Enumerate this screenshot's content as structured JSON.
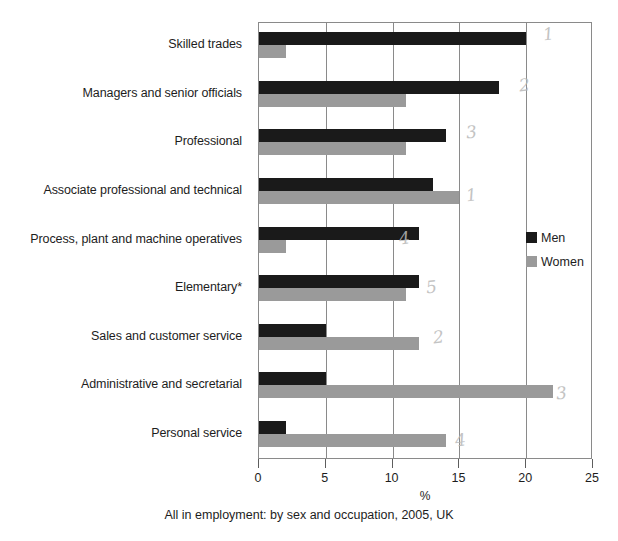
{
  "chart_data": {
    "type": "bar",
    "orientation": "horizontal",
    "title": "",
    "caption": "All in employment: by sex and occupation, 2005, UK",
    "xlabel": "%",
    "ylabel": "",
    "xlim": [
      0,
      25
    ],
    "xticks": [
      0,
      5,
      10,
      15,
      20,
      25
    ],
    "xticklabels": [
      "0",
      "5",
      "10",
      "15",
      "20",
      "25"
    ],
    "grid": "vertical",
    "legend_position": "right",
    "categories": [
      "Skilled trades",
      "Managers and senior officials",
      "Professional",
      "Associate professional and technical",
      "Process, plant and machine operatives",
      "Elementary*",
      "Sales and customer service",
      "Administrative and secretarial",
      "Personal service"
    ],
    "series": [
      {
        "name": "Men",
        "color": "#1a1a1a",
        "values": [
          20,
          18,
          14,
          13,
          12,
          12,
          5,
          5,
          2
        ]
      },
      {
        "name": "Women",
        "color": "#9a9a9a",
        "values": [
          2,
          11,
          11,
          15,
          2,
          11,
          12,
          22,
          14
        ]
      }
    ]
  },
  "legend": {
    "entries": [
      {
        "label": "Men"
      },
      {
        "label": "Women"
      }
    ]
  },
  "annotations": {
    "pencil_marks": [
      {
        "text": "1",
        "x": 543,
        "y": 24
      },
      {
        "text": "2",
        "x": 519,
        "y": 75
      },
      {
        "text": "3",
        "x": 466,
        "y": 122
      },
      {
        "text": "1",
        "x": 466,
        "y": 185
      },
      {
        "text": "4",
        "x": 399,
        "y": 228
      },
      {
        "text": "5",
        "x": 426,
        "y": 277
      },
      {
        "text": "2",
        "x": 433,
        "y": 327
      },
      {
        "text": "3",
        "x": 556,
        "y": 383
      },
      {
        "text": "4",
        "x": 455,
        "y": 430
      }
    ]
  }
}
